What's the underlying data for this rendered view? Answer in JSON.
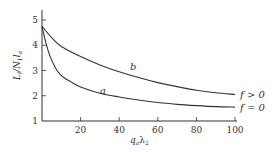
{
  "chart_data": {
    "type": "line",
    "title": "",
    "xlabel": "q_a λ_2",
    "ylabel": "L_l / N_1 l_a",
    "xlim": [
      0,
      100
    ],
    "ylim": [
      1,
      5
    ],
    "grid": false,
    "x_ticks": [
      20,
      40,
      60,
      80,
      100
    ],
    "y_ticks": [
      1,
      2,
      3,
      4,
      5
    ],
    "series": [
      {
        "name": "b",
        "end_label": "f > 0",
        "x": [
          0,
          5,
          10,
          20,
          30,
          40,
          50,
          60,
          70,
          80,
          90,
          100
        ],
        "values": [
          4.75,
          4.3,
          3.95,
          3.55,
          3.22,
          2.95,
          2.72,
          2.52,
          2.36,
          2.22,
          2.12,
          2.05
        ]
      },
      {
        "name": "a",
        "end_label": "f = 0",
        "x": [
          0,
          2,
          4,
          7,
          10,
          15,
          20,
          30,
          40,
          50,
          60,
          70,
          80,
          90,
          100
        ],
        "values": [
          4.75,
          4.1,
          3.6,
          3.1,
          2.8,
          2.55,
          2.35,
          2.1,
          1.95,
          1.83,
          1.73,
          1.66,
          1.61,
          1.57,
          1.55
        ]
      }
    ]
  },
  "labels": {
    "ylabel_main": "L",
    "ylabel_sub1": "l",
    "ylabel_mid": "/N",
    "ylabel_sub2": "1",
    "ylabel_end": "l",
    "ylabel_sub3": "a",
    "xlabel_main": "q",
    "xlabel_sub1": "a",
    "xlabel_mid": "λ",
    "xlabel_sub2": "2",
    "curve_b": "b",
    "curve_a": "a",
    "end_b": "f > 0",
    "end_a": "f = 0"
  }
}
